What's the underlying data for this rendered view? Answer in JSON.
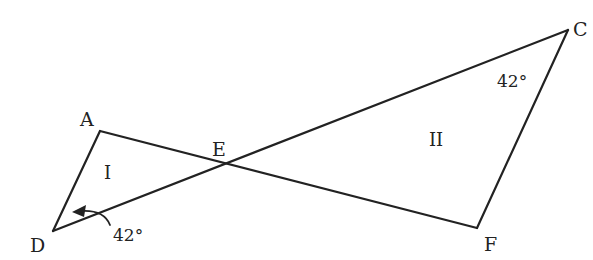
{
  "diagram": {
    "points": {
      "A": {
        "label": "A",
        "x": 100,
        "y": 131
      },
      "D": {
        "label": "D",
        "x": 53,
        "y": 231
      },
      "E": {
        "label": "E",
        "x": 223,
        "y": 165
      },
      "C": {
        "label": "C",
        "x": 568,
        "y": 30
      },
      "F": {
        "label": "F",
        "x": 477,
        "y": 228
      }
    },
    "segments": [
      "AD",
      "AF",
      "DC",
      "CF"
    ],
    "angles": {
      "D": "42°",
      "C": "42°"
    },
    "regions": {
      "triangle_1": "I",
      "triangle_2": "II"
    },
    "stroke_color": "#222222"
  }
}
